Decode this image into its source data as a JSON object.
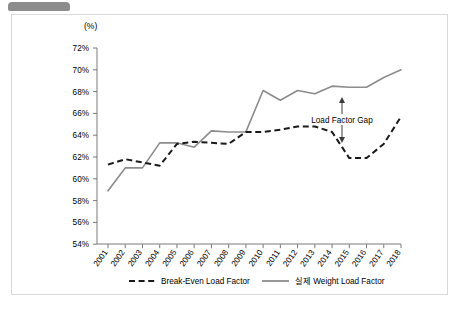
{
  "card": {
    "unit_label": "(%)"
  },
  "annotation": {
    "gap_label": "Load Factor Gap"
  },
  "legend": {
    "items": [
      {
        "label": "Break-Even Load Factor",
        "style": "dashed",
        "color": "#1a1a1a"
      },
      {
        "label": "실제 Weight Load Factor",
        "style": "solid",
        "color": "#8c8c8c"
      }
    ]
  },
  "chart_data": {
    "type": "line",
    "title": "",
    "subtitle": "",
    "xlabel": "",
    "ylabel": "(%)",
    "ylim": [
      54,
      72
    ],
    "ytick_step": 2,
    "ytick_labels": [
      "54%",
      "56%",
      "58%",
      "60%",
      "62%",
      "64%",
      "66%",
      "68%",
      "70%",
      "72%"
    ],
    "grid": false,
    "legend_position": "bottom",
    "categories": [
      "2001",
      "2002",
      "2003",
      "2004",
      "2005",
      "2006",
      "2007",
      "2008",
      "2009",
      "2010",
      "2011",
      "2012",
      "2013",
      "2014",
      "2015",
      "2016",
      "2017",
      "2018"
    ],
    "series": [
      {
        "name": "Break-Even Load Factor",
        "style": "dashed",
        "color": "#1a1a1a",
        "values": [
          61.3,
          61.8,
          61.5,
          61.2,
          63.2,
          63.4,
          63.3,
          63.2,
          64.3,
          64.3,
          64.5,
          64.8,
          64.8,
          64.3,
          61.9,
          61.9,
          63.2,
          65.7
        ]
      },
      {
        "name": "실제 Weight Load Factor",
        "style": "solid",
        "color": "#8c8c8c",
        "values": [
          58.9,
          61.0,
          61.0,
          63.3,
          63.3,
          62.9,
          64.4,
          64.3,
          64.3,
          68.1,
          67.2,
          68.1,
          67.8,
          68.5,
          68.4,
          68.4,
          69.3,
          70.0
        ]
      }
    ],
    "annotations": [
      {
        "text": "Load Factor Gap",
        "x_category": "2016",
        "y_value": 66.0,
        "arrow": "double-vertical"
      }
    ]
  }
}
